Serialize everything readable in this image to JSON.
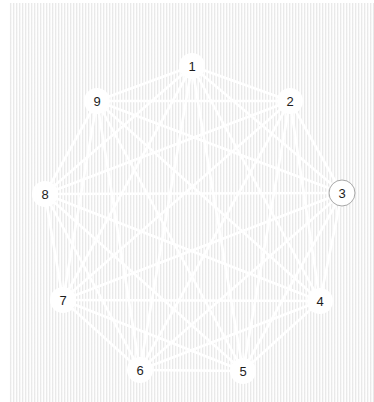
{
  "figure": {
    "type": "graph-diagram",
    "background_color": "#eeeeee",
    "edge_color": "#ffffff",
    "label_color": "#1d1d1d",
    "selected_outline_color": "#a8a8a8"
  },
  "graph": {
    "node_count": 9,
    "edge_count": 36,
    "selected_node_id": "3",
    "nodes": [
      {
        "id": "1",
        "label": "1",
        "cx": 192,
        "cy": 66,
        "r": 13,
        "selected": false
      },
      {
        "id": "2",
        "label": "2",
        "cx": 290,
        "cy": 101,
        "r": 13,
        "selected": false
      },
      {
        "id": "3",
        "label": "3",
        "cx": 342,
        "cy": 193,
        "r": 13,
        "selected": true
      },
      {
        "id": "4",
        "label": "4",
        "cx": 320,
        "cy": 301,
        "r": 13,
        "selected": false
      },
      {
        "id": "5",
        "label": "5",
        "cx": 243,
        "cy": 371,
        "r": 13,
        "selected": false
      },
      {
        "id": "6",
        "label": "6",
        "cx": 140,
        "cy": 370,
        "r": 13,
        "selected": false
      },
      {
        "id": "7",
        "label": "7",
        "cx": 63,
        "cy": 300,
        "r": 13,
        "selected": false
      },
      {
        "id": "8",
        "label": "8",
        "cx": 45,
        "cy": 194,
        "r": 13,
        "selected": false
      },
      {
        "id": "9",
        "label": "9",
        "cx": 97,
        "cy": 101,
        "r": 13,
        "selected": false
      }
    ],
    "edges": [
      [
        "1",
        "2"
      ],
      [
        "1",
        "3"
      ],
      [
        "1",
        "4"
      ],
      [
        "1",
        "5"
      ],
      [
        "1",
        "6"
      ],
      [
        "1",
        "7"
      ],
      [
        "1",
        "8"
      ],
      [
        "1",
        "9"
      ],
      [
        "2",
        "3"
      ],
      [
        "2",
        "4"
      ],
      [
        "2",
        "5"
      ],
      [
        "2",
        "6"
      ],
      [
        "2",
        "7"
      ],
      [
        "2",
        "8"
      ],
      [
        "2",
        "9"
      ],
      [
        "3",
        "4"
      ],
      [
        "3",
        "5"
      ],
      [
        "3",
        "6"
      ],
      [
        "3",
        "7"
      ],
      [
        "3",
        "8"
      ],
      [
        "3",
        "9"
      ],
      [
        "4",
        "5"
      ],
      [
        "4",
        "6"
      ],
      [
        "4",
        "7"
      ],
      [
        "4",
        "8"
      ],
      [
        "4",
        "9"
      ],
      [
        "5",
        "6"
      ],
      [
        "5",
        "7"
      ],
      [
        "5",
        "8"
      ],
      [
        "5",
        "9"
      ],
      [
        "6",
        "7"
      ],
      [
        "6",
        "8"
      ],
      [
        "6",
        "9"
      ],
      [
        "7",
        "8"
      ],
      [
        "7",
        "9"
      ],
      [
        "8",
        "9"
      ]
    ]
  }
}
